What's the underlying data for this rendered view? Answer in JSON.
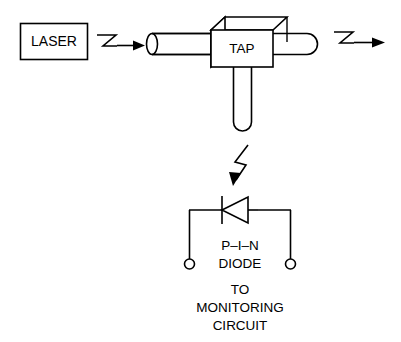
{
  "diagram": {
    "background_color": "#ffffff",
    "line_color": "#000000",
    "source": {
      "label": "LASER",
      "shape": "rectangle"
    },
    "tap": {
      "label": "TAP",
      "shape": "3d-box"
    },
    "detector": {
      "label_line1": "P–I–N",
      "label_line2": "DIODE",
      "symbol": "diode"
    },
    "output": {
      "line1": "TO",
      "line2": "MONITORING",
      "line3": "CIRCUIT"
    },
    "arrows": {
      "input_beam": "zigzag-arrow-right",
      "output_beam": "zigzag-arrow-right",
      "tapped_beam": "zigzag-arrow-down"
    },
    "terminals": {
      "left": "terminal-open-circle",
      "right": "terminal-open-circle"
    }
  }
}
